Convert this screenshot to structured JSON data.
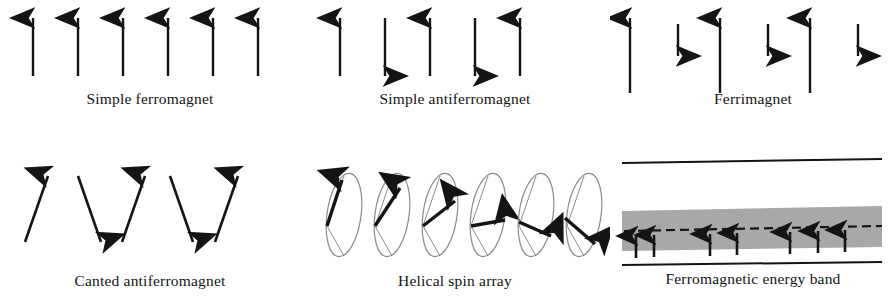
{
  "figure": {
    "background_color": "#ffffff",
    "ink_color": "#141414",
    "band_fill_color": "#a8a8a8",
    "ellipse_stroke_color": "#8c8c8c"
  },
  "panels": [
    {
      "id": "simple-ferromagnet",
      "label": "Simple ferromagnet",
      "kind": "vertical-arrows",
      "arrows": [
        {
          "x": 33,
          "dir": "up",
          "length": 58
        },
        {
          "x": 78,
          "dir": "up",
          "length": 58
        },
        {
          "x": 123,
          "dir": "up",
          "length": 58
        },
        {
          "x": 168,
          "dir": "up",
          "length": 58
        },
        {
          "x": 213,
          "dir": "up",
          "length": 58
        },
        {
          "x": 258,
          "dir": "up",
          "length": 58
        }
      ]
    },
    {
      "id": "simple-antiferromagnet",
      "label": "Simple antiferromagnet",
      "kind": "vertical-arrows",
      "arrows": [
        {
          "x": 40,
          "dir": "up",
          "length": 58
        },
        {
          "x": 85,
          "dir": "down",
          "length": 58
        },
        {
          "x": 130,
          "dir": "up",
          "length": 58
        },
        {
          "x": 175,
          "dir": "down",
          "length": 58
        },
        {
          "x": 220,
          "dir": "up",
          "length": 58
        }
      ]
    },
    {
      "id": "ferrimagnet",
      "label": "Ferrimagnet",
      "kind": "vertical-arrows",
      "arrows": [
        {
          "x": 20,
          "dir": "up",
          "length": 75
        },
        {
          "x": 68,
          "dir": "down",
          "length": 32
        },
        {
          "x": 110,
          "dir": "up",
          "length": 75
        },
        {
          "x": 158,
          "dir": "down",
          "length": 32
        },
        {
          "x": 200,
          "dir": "up",
          "length": 75
        },
        {
          "x": 248,
          "dir": "down",
          "length": 32
        }
      ]
    },
    {
      "id": "canted-antiferromagnet",
      "label": "Canted antiferromagnet",
      "kind": "canted-arrows",
      "arrows": [
        {
          "x": 40,
          "dir": "up",
          "tilt_deg": 17
        },
        {
          "x": 90,
          "dir": "down",
          "tilt_deg": 17
        },
        {
          "x": 135,
          "dir": "up",
          "tilt_deg": 17
        },
        {
          "x": 182,
          "dir": "down",
          "tilt_deg": 17
        },
        {
          "x": 228,
          "dir": "up",
          "tilt_deg": 17
        }
      ]
    },
    {
      "id": "helical-spin-array",
      "label": "Helical spin array",
      "kind": "helical-ellipses",
      "spins": [
        {
          "x": 40,
          "angle_deg": -72
        },
        {
          "x": 88,
          "angle_deg": -48
        },
        {
          "x": 136,
          "angle_deg": -24
        },
        {
          "x": 184,
          "angle_deg": 0
        },
        {
          "x": 232,
          "angle_deg": 22
        },
        {
          "x": 280,
          "angle_deg": 44
        }
      ]
    },
    {
      "id": "ferromagnetic-energy-band",
      "label": "Ferromagnetic energy band",
      "kind": "energy-band",
      "top_line": true,
      "bottom_line": true,
      "dashed_fermi_level": true,
      "band_arrows_x": [
        26,
        44,
        100,
        127,
        180,
        208,
        235
      ]
    }
  ]
}
